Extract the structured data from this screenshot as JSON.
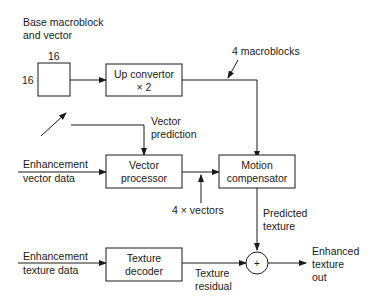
{
  "diagram": {
    "labels": {
      "base_line1": "Base macroblock",
      "base_line2": "and vector",
      "dim_top": "16",
      "dim_left": "16",
      "four_macroblocks": "4 macroblocks",
      "vector_prediction_line1": "Vector",
      "vector_prediction_line2": "prediction",
      "enh_vector_line1": "Enhancement",
      "enh_vector_line2": "vector data",
      "four_vectors": "4 × vectors",
      "predicted_line1": "Predicted",
      "predicted_line2": "texture",
      "enh_texture_line1": "Enhancement",
      "enh_texture_line2": "texture data",
      "residual_line1": "Texture",
      "residual_line2": "residual",
      "out_line1": "Enhanced",
      "out_line2": "texture",
      "out_line3": "out",
      "adder_symbol": "+"
    },
    "blocks": {
      "up_convertor": {
        "line1": "Up convertor",
        "line2": "× 2"
      },
      "vector_processor": {
        "line1": "Vector",
        "line2": "processor"
      },
      "motion_compensator": {
        "line1": "Motion",
        "line2": "compensator"
      },
      "texture_decoder": {
        "line1": "Texture",
        "line2": "decoder"
      }
    },
    "colors": {
      "stroke": "#1a1a1a",
      "background": "#ffffff"
    }
  }
}
